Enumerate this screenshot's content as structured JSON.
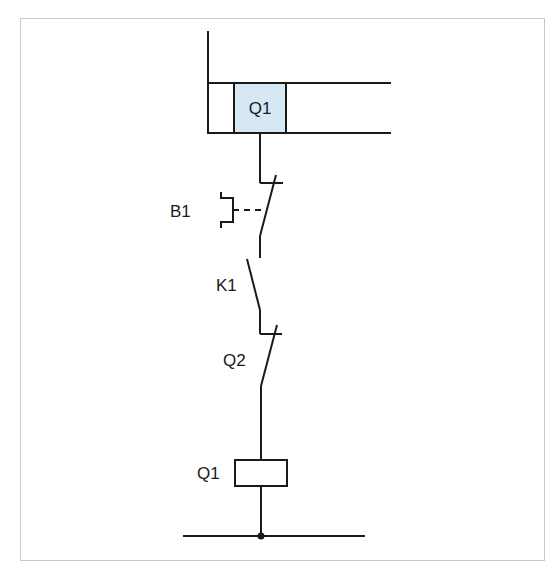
{
  "diagram": {
    "type": "control-circuit-schematic",
    "colors": {
      "line": "#1a1a1a",
      "highlight_fill": "#d6e8f3",
      "frame": "#c9c9c9"
    },
    "top_block": {
      "label": "Q1",
      "highlighted": true
    },
    "components": [
      {
        "id": "B1",
        "label": "B1",
        "kind": "pushbutton-normally-closed"
      },
      {
        "id": "K1",
        "label": "K1",
        "kind": "contact-normally-open"
      },
      {
        "id": "Q2",
        "label": "Q2",
        "kind": "contact-normally-closed"
      },
      {
        "id": "Q1coil",
        "label": "Q1",
        "kind": "coil"
      }
    ]
  }
}
